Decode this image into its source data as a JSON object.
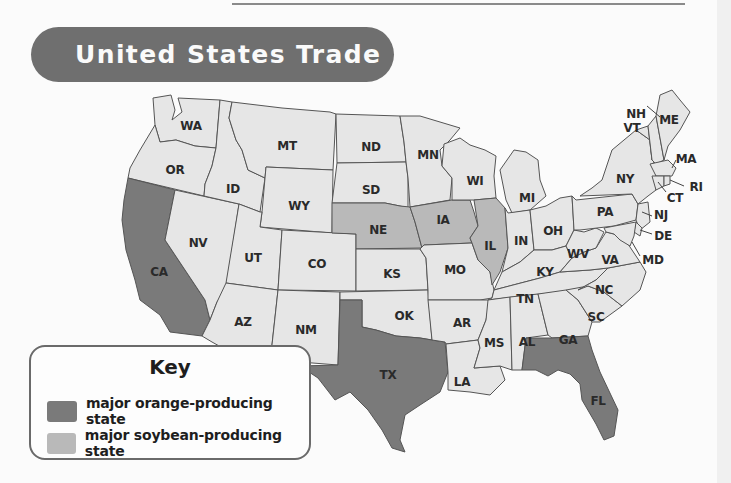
{
  "title": "United States Trade",
  "colors": {
    "title_banner": "#6f6f6f",
    "orange_state": "#7a7a7a",
    "soybean_state": "#b9b9b9",
    "other_state": "#e6e6e6",
    "border": "#555555"
  },
  "key": {
    "title": "Key",
    "items": [
      {
        "label": "major orange-producing state",
        "color": "#7a7a7a",
        "category": "orange"
      },
      {
        "label": "major soybean-producing state",
        "color": "#b9b9b9",
        "category": "soybean"
      }
    ]
  },
  "map": {
    "orange_states": [
      "CA",
      "TX",
      "FL"
    ],
    "soybean_states": [
      "NE",
      "IA",
      "IL"
    ],
    "states": {
      "WA": "WA",
      "OR": "OR",
      "CA": "CA",
      "NV": "NV",
      "ID": "ID",
      "MT": "MT",
      "WY": "WY",
      "UT": "UT",
      "AZ": "AZ",
      "CO": "CO",
      "NM": "NM",
      "ND": "ND",
      "SD": "SD",
      "NE": "NE",
      "KS": "KS",
      "OK": "OK",
      "TX": "TX",
      "MN": "MN",
      "IA": "IA",
      "MO": "MO",
      "AR": "AR",
      "LA": "LA",
      "WI": "WI",
      "IL": "IL",
      "MI": "MI",
      "IN": "IN",
      "OH": "OH",
      "KY": "KY",
      "TN": "TN",
      "MS": "MS",
      "AL": "AL",
      "GA": "GA",
      "FL": "FL",
      "SC": "SC",
      "NC": "NC",
      "VA": "VA",
      "WV": "WV",
      "PA": "PA",
      "NY": "NY",
      "VT": "VT",
      "NH": "NH",
      "ME": "ME",
      "MA": "MA",
      "RI": "RI",
      "CT": "CT",
      "NJ": "NJ",
      "DE": "DE",
      "MD": "MD"
    }
  }
}
